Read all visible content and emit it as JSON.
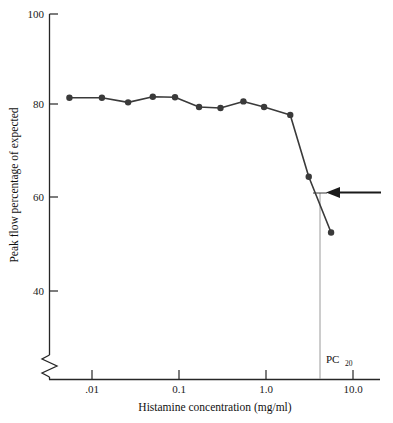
{
  "chart_data": {
    "type": "line",
    "title": "",
    "xlabel": "Histamine concentration (mg/ml)",
    "ylabel": "Peak flow percentage of expected",
    "xscale": "log",
    "xlim": [
      0.004,
      13.0
    ],
    "ylim": [
      34,
      100
    ],
    "yticks": [
      40,
      60,
      80,
      100
    ],
    "ytick_labels": [
      "40",
      "60",
      "80",
      "100"
    ],
    "xticks": [
      0.01,
      0.1,
      1.0,
      10.0
    ],
    "xtick_labels": [
      ".01",
      "0.1",
      "1.0",
      "10.0"
    ],
    "grid": false,
    "legend": false,
    "y_axis_break": true,
    "series": [
      {
        "name": "Peak flow response",
        "marker": "filled-circle",
        "color": "#3a3a3a",
        "x": [
          0.0055,
          0.013,
          0.026,
          0.05,
          0.09,
          0.17,
          0.3,
          0.55,
          0.95,
          1.9,
          3.1,
          5.6
        ],
        "y": [
          82.0,
          82.0,
          81.0,
          82.2,
          82.1,
          80.0,
          79.8,
          81.2,
          80.0,
          78.3,
          65.0,
          53.0
        ]
      }
    ],
    "annotations": [
      {
        "name": "pc20-marker",
        "label": "PC",
        "label_subscript": "20",
        "x": 3.55,
        "y_guide_top": 61.0,
        "description": "vertical guide line dropped from the curve at 20% fall, with arrow pointing to it"
      },
      {
        "name": "arrow-pointer",
        "direction": "left",
        "y": 61.0,
        "description": "horizontal arrow pointing left at the PC20 intersection"
      }
    ]
  },
  "colors": {
    "axis": "#262626",
    "line": "#3a3a3a",
    "marker": "#3a3a3a",
    "guide": "#9a9a9a",
    "arrow": "#1a1a1a",
    "background": "#ffffff"
  }
}
